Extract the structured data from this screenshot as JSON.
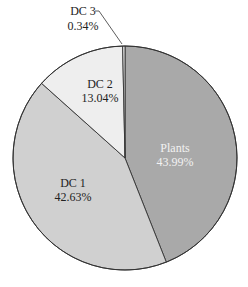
{
  "chart_data": {
    "type": "pie",
    "title": "",
    "start": "top",
    "direction": "clockwise",
    "slices": [
      {
        "label": "Plants",
        "value": 43.99,
        "display": "43.99%",
        "color": "#a9a9a9",
        "text_color": "#f2f2f2"
      },
      {
        "label": "DC 1",
        "value": 42.63,
        "display": "42.63%",
        "color": "#d0d0d0",
        "text_color": "#222222"
      },
      {
        "label": "DC 2",
        "value": 13.04,
        "display": "13.04%",
        "color": "#eeeeee",
        "text_color": "#222222"
      },
      {
        "label": "DC 3",
        "value": 0.34,
        "display": "0.34%",
        "color": "#e6e6e6",
        "text_color": "#222222"
      }
    ],
    "outline_color": "#333333"
  }
}
